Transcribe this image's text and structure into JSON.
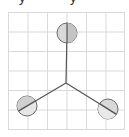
{
  "caption": {
    "fragments": [
      "y",
      "y"
    ]
  },
  "diagram": {
    "type": "three-pronged molecular/vector diagram on grid",
    "grid": {
      "x0": 8,
      "y0": 12,
      "cols": 6,
      "rows": 6,
      "cell": 19.5,
      "color": "#d9d9d9"
    },
    "center": {
      "x": 66,
      "y": 83
    },
    "nodes": [
      {
        "name": "top",
        "x": 67,
        "y": 33,
        "r": 10
      },
      {
        "name": "bottom-left",
        "x": 27,
        "y": 106,
        "r": 10
      },
      {
        "name": "bottom-right",
        "x": 108,
        "y": 109,
        "r": 10
      }
    ],
    "colors": {
      "line": "#555555",
      "node_fill": "#d8d8d8",
      "node_stroke": "#6a6a6a",
      "node_highlight": "#efefef"
    }
  }
}
